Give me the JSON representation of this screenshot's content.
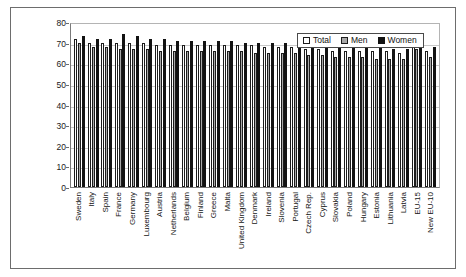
{
  "chart_data": {
    "type": "bar",
    "title": "",
    "xlabel": "",
    "ylabel": "",
    "ylim": [
      0,
      80
    ],
    "yticks": [
      0,
      10,
      20,
      30,
      40,
      50,
      60,
      70,
      80
    ],
    "grid": true,
    "legend_position": "top-right",
    "categories": [
      "Sweden",
      "Italy",
      "Spain",
      "France",
      "Germany",
      "Luxembourg",
      "Austria",
      "Netherlands",
      "Belgium",
      "Finland",
      "Greece",
      "Malta",
      "United Kingdom",
      "Denmark",
      "Ireland",
      "Slovenia",
      "Portugal",
      "Czech Rep.",
      "Cyprus",
      "Slovakia",
      "Poland",
      "Hungary",
      "Estonia",
      "Lithuania",
      "Latvia",
      "EU-15",
      "New EU-10"
    ],
    "series": [
      {
        "name": "Total",
        "values": [
          72,
          70,
          70,
          70,
          70,
          70,
          69,
          69,
          69,
          69,
          69,
          69,
          69,
          69,
          68,
          68,
          68,
          67,
          67,
          66,
          66,
          66,
          66,
          66,
          65,
          69,
          66
        ]
      },
      {
        "name": "Men",
        "values": [
          70,
          68,
          68,
          67,
          67,
          67,
          66,
          66,
          66,
          66,
          66,
          66,
          66,
          65,
          65,
          65,
          65,
          64,
          64,
          63,
          63,
          63,
          62,
          62,
          62,
          67,
          63
        ]
      },
      {
        "name": "Women",
        "values": [
          73,
          72,
          72,
          74,
          73,
          72,
          72,
          71,
          71,
          71,
          71,
          71,
          70,
          70,
          70,
          70,
          70,
          69,
          69,
          68,
          68,
          68,
          68,
          67,
          67,
          71,
          68
        ]
      }
    ]
  },
  "legend": {
    "items": [
      {
        "label": "Total",
        "swatch": "white-square-outline"
      },
      {
        "label": "Men",
        "swatch": "gray-square"
      },
      {
        "label": "Women",
        "swatch": "black-square"
      }
    ]
  },
  "colors": {
    "total": "#ffffff",
    "men": "#a8a8a8",
    "women": "#121212",
    "axis": "#7a7a7a",
    "grid": "#c9c9c9",
    "border": "#6d6d6d"
  }
}
